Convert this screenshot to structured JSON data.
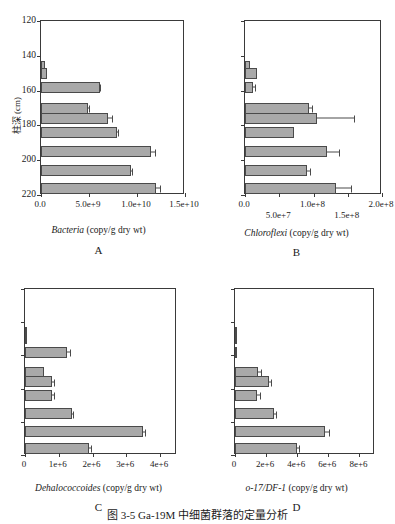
{
  "figure": {
    "caption": "图 3-5  Ga-19M 中细菌群落的定量分析",
    "bar_color": "#a9a9a9",
    "line_color": "#4a4a4a"
  },
  "chart_data": [
    {
      "type": "bar",
      "panel": "A",
      "title": "",
      "xlabel": "Bacteria (copy/g dry wt)",
      "xlabel_species": "Bacteria",
      "xlabel_rest": " (copy/g dry wt)",
      "ylabel": "柱深 (cm)",
      "orientation": "horizontal",
      "grid": false,
      "xlim": [
        0,
        15000000000
      ],
      "ylim": [
        220,
        120
      ],
      "xticks": [
        0,
        5000000000,
        10000000000,
        15000000000
      ],
      "xticklabels": [
        "0.0",
        "5.0e+9",
        "1.0e+10",
        "1.5e+10"
      ],
      "yticks": [
        120,
        140,
        160,
        180,
        200,
        220
      ],
      "yticklabels": [
        "120",
        "140",
        "160",
        "180",
        "200",
        "220"
      ],
      "categories": [
        146,
        150,
        158,
        170,
        176,
        184,
        195,
        206,
        216
      ],
      "values": [
        450000000,
        600000000,
        6100000000,
        4900000000,
        7000000000,
        7900000000,
        11500000000,
        9400000000,
        12000000000
      ],
      "errors": [
        0,
        0,
        150000000,
        100000000,
        400000000,
        150000000,
        400000000,
        150000000,
        450000000
      ]
    },
    {
      "type": "bar",
      "panel": "B",
      "title": "",
      "xlabel": "Chloroflexi (copy/g dry wt)",
      "xlabel_species": "Chloroflexi",
      "xlabel_rest": " (copy/g dry wt)",
      "ylabel": "",
      "orientation": "horizontal",
      "grid": false,
      "xlim": [
        0,
        200000000
      ],
      "ylim": [
        220,
        120
      ],
      "xticks": [
        0,
        50000000,
        100000000,
        150000000,
        200000000
      ],
      "xticklabels": [
        "0.0",
        "5.0e+7",
        "1.0e+8",
        "1.5e+8",
        "2.0e+8"
      ],
      "xticklabel_rows": [
        0,
        1,
        0,
        1,
        0
      ],
      "yticks": [
        120,
        140,
        160,
        180,
        200,
        220
      ],
      "yticklabels": [
        "",
        "",
        "",
        "",
        "",
        ""
      ],
      "categories": [
        146,
        150,
        158,
        170,
        176,
        184,
        195,
        206,
        216
      ],
      "values": [
        7000000,
        17000000,
        12000000,
        93000000,
        105000000,
        72000000,
        120000000,
        90000000,
        133000000
      ],
      "errors": [
        0,
        0,
        4000000,
        6000000,
        55000000,
        0,
        18000000,
        6000000,
        22000000
      ]
    },
    {
      "type": "bar",
      "panel": "C",
      "title": "",
      "xlabel": "Dehalococcoides (copy/g dry wt)",
      "xlabel_species": "Dehalococcoides",
      "xlabel_rest": " (copy/g dry wt)",
      "ylabel": "",
      "orientation": "horizontal",
      "grid": false,
      "xlim": [
        0,
        4500000
      ],
      "ylim": [
        220,
        120
      ],
      "xticks": [
        0,
        1000000,
        2000000,
        3000000,
        4000000
      ],
      "xticklabels": [
        "0",
        "1e+6",
        "2e+6",
        "3e+6",
        "4e+6"
      ],
      "yticks": [
        120,
        140,
        160,
        180,
        200,
        220
      ],
      "yticklabels": [
        "",
        "",
        "",
        "",
        "",
        ""
      ],
      "categories": [
        146,
        150,
        158,
        170,
        176,
        184,
        195,
        206,
        216
      ],
      "values": [
        30000,
        40000,
        1250000,
        550000,
        800000,
        800000,
        1400000,
        3500000,
        1900000
      ],
      "errors": [
        0,
        0,
        100000,
        0,
        60000,
        60000,
        40000,
        60000,
        80000
      ]
    },
    {
      "type": "bar",
      "panel": "D",
      "title": "",
      "xlabel": "o-17/DF-1 (copy/g dry wt)",
      "xlabel_species": "o-17/DF-1",
      "xlabel_rest": " (copy/g dry wt)",
      "ylabel": "",
      "orientation": "horizontal",
      "grid": false,
      "xlim": [
        0,
        9000000
      ],
      "ylim": [
        220,
        120
      ],
      "xticks": [
        0,
        2000000,
        4000000,
        6000000,
        8000000
      ],
      "xticklabels": [
        "0",
        "2e+6",
        "4e+6",
        "6e+6",
        "8e+6"
      ],
      "yticks": [
        120,
        140,
        160,
        180,
        200,
        220
      ],
      "yticklabels": [
        "",
        "",
        "",
        "",
        "",
        ""
      ],
      "categories": [
        146,
        150,
        158,
        170,
        176,
        184,
        195,
        206,
        216
      ],
      "values": [
        60000,
        80000,
        70000,
        1500000,
        2200000,
        1400000,
        2500000,
        5800000,
        4000000
      ],
      "errors": [
        0,
        0,
        0,
        200000,
        150000,
        250000,
        200000,
        300000,
        150000
      ]
    }
  ]
}
